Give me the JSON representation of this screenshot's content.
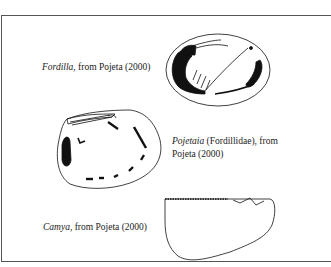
{
  "figure": {
    "items": [
      {
        "genus": "Fordilla",
        "suffix": ", from Pojeta (2000)"
      },
      {
        "genus": "Pojetaia",
        "suffix": " (Fordillidae), from",
        "line2": "Pojeta (2000)"
      },
      {
        "genus": "Camya",
        "suffix": ", from Pojeta (2000)"
      }
    ]
  }
}
